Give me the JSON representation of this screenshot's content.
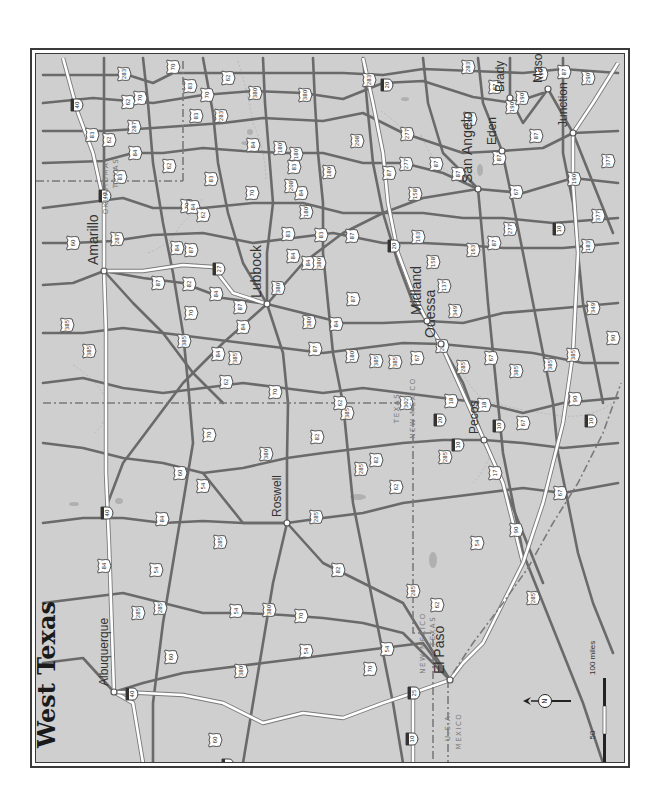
{
  "title": "West Texas",
  "orientation": "rotated-90-north-left",
  "colors": {
    "background": "#cfcfcf",
    "frame": "#3a3a3a",
    "us_highway": "#6a6a6a",
    "interstate": "#ffffff",
    "border": "#7a7a7a",
    "water": "#b0b0b0"
  },
  "cities": [
    {
      "name": "Amarillo",
      "x": 101,
      "y": 268,
      "label_dx": 12,
      "label_dy": -2,
      "size": "lg"
    },
    {
      "name": "Lubbock",
      "x": 264,
      "y": 301,
      "label_dx": -6,
      "label_dy": -22,
      "size": "lg"
    },
    {
      "name": "Albuquerque",
      "x": 111,
      "y": 689,
      "label_dx": 10,
      "label_dy": -10,
      "size": "sm"
    },
    {
      "name": "Roswell",
      "x": 284,
      "y": 520,
      "label_dx": 4,
      "label_dy": -6,
      "size": "sm"
    },
    {
      "name": "El Paso",
      "x": 447,
      "y": 677,
      "label_dx": -10,
      "label_dy": -14,
      "size": "lg"
    },
    {
      "name": "Pecos",
      "x": 481,
      "y": 437,
      "label_dx": 10,
      "label_dy": 4,
      "size": "sm"
    },
    {
      "name": "Odessa",
      "x": 438,
      "y": 341,
      "label_dx": 4,
      "label_dy": -4,
      "size": "lg"
    },
    {
      "name": "Midland",
      "x": 424,
      "y": 318,
      "label_dx": -6,
      "label_dy": -6,
      "size": "lg"
    },
    {
      "name": "San Angelo",
      "x": 475,
      "y": 186,
      "label_dx": 6,
      "label_dy": -6,
      "size": "lg"
    },
    {
      "name": "Eden",
      "x": 499,
      "y": 148,
      "label_dx": 4,
      "label_dy": 4,
      "size": "sm"
    },
    {
      "name": "Brady",
      "x": 507,
      "y": 95,
      "label_dx": 4,
      "label_dy": 6,
      "size": "sm"
    },
    {
      "name": "Mason",
      "x": 545,
      "y": 86,
      "label_dx": -6,
      "label_dy": -4,
      "size": "sm"
    },
    {
      "name": "Junction",
      "x": 570,
      "y": 130,
      "label_dx": 8,
      "label_dy": 4,
      "size": "sm"
    }
  ],
  "state_labels": [
    {
      "text": "OKLAHOMA",
      "x": 105,
      "y": 185
    },
    {
      "text": "TEXAS",
      "x": 115,
      "y": 170
    },
    {
      "text": "TEXAS",
      "x": 396,
      "y": 405
    },
    {
      "text": "NEW MEXICO",
      "x": 412,
      "y": 405
    },
    {
      "text": "NEW MEXICO",
      "x": 422,
      "y": 640
    },
    {
      "text": "TEXAS",
      "x": 432,
      "y": 628
    },
    {
      "text": "U.S.A.",
      "x": 447,
      "y": 723
    },
    {
      "text": "MEXICO",
      "x": 458,
      "y": 728
    }
  ],
  "shields": [
    {
      "type": "I",
      "num": "40",
      "x": 128,
      "y": 691
    },
    {
      "type": "I",
      "num": "40",
      "x": 103,
      "y": 510
    },
    {
      "type": "I",
      "num": "40",
      "x": 73,
      "y": 102
    },
    {
      "type": "I",
      "num": "40",
      "x": 101,
      "y": 193
    },
    {
      "type": "I",
      "num": "25",
      "x": 410,
      "y": 690
    },
    {
      "type": "I",
      "num": "25",
      "x": 224,
      "y": 762
    },
    {
      "type": "I",
      "num": "10",
      "x": 408,
      "y": 736
    },
    {
      "type": "I",
      "num": "10",
      "x": 454,
      "y": 442
    },
    {
      "type": "I",
      "num": "10",
      "x": 495,
      "y": 423
    },
    {
      "type": "I",
      "num": "10",
      "x": 587,
      "y": 418
    },
    {
      "type": "I",
      "num": "10",
      "x": 555,
      "y": 226
    },
    {
      "type": "I",
      "num": "20",
      "x": 390,
      "y": 243
    },
    {
      "type": "I",
      "num": "20",
      "x": 436,
      "y": 417
    },
    {
      "type": "I",
      "num": "27",
      "x": 215,
      "y": 266
    },
    {
      "type": "I",
      "num": "20",
      "x": 383,
      "y": 82
    },
    {
      "type": "US",
      "num": "60",
      "x": 70,
      "y": 240
    },
    {
      "type": "US",
      "num": "287",
      "x": 114,
      "y": 236
    },
    {
      "type": "US",
      "num": "83",
      "x": 117,
      "y": 174
    },
    {
      "type": "US",
      "num": "62",
      "x": 125,
      "y": 99
    },
    {
      "type": "US",
      "num": "283",
      "x": 121,
      "y": 71
    },
    {
      "type": "US",
      "num": "70",
      "x": 184,
      "y": 203
    },
    {
      "type": "US",
      "num": "83",
      "x": 208,
      "y": 176
    },
    {
      "type": "US",
      "num": "70",
      "x": 204,
      "y": 92
    },
    {
      "type": "US",
      "num": "87",
      "x": 237,
      "y": 304
    },
    {
      "type": "US",
      "num": "84",
      "x": 174,
      "y": 245
    },
    {
      "type": "US",
      "num": "84",
      "x": 240,
      "y": 324
    },
    {
      "type": "US",
      "num": "385",
      "x": 86,
      "y": 348
    },
    {
      "type": "US",
      "num": "385",
      "x": 232,
      "y": 355
    },
    {
      "type": "US",
      "num": "62",
      "x": 223,
      "y": 379
    },
    {
      "type": "US",
      "num": "70",
      "x": 272,
      "y": 389
    },
    {
      "type": "US",
      "num": "84",
      "x": 290,
      "y": 253
    },
    {
      "type": "US",
      "num": "380",
      "x": 252,
      "y": 90
    },
    {
      "type": "US",
      "num": "380",
      "x": 306,
      "y": 319
    },
    {
      "type": "US",
      "num": "180",
      "x": 293,
      "y": 151
    },
    {
      "type": "US",
      "num": "83",
      "x": 318,
      "y": 232
    },
    {
      "type": "US",
      "num": "87",
      "x": 350,
      "y": 296
    },
    {
      "type": "US",
      "num": "84",
      "x": 305,
      "y": 260
    },
    {
      "type": "US",
      "num": "385",
      "x": 373,
      "y": 358
    },
    {
      "type": "US",
      "num": "180",
      "x": 349,
      "y": 353
    },
    {
      "type": "US",
      "num": "285",
      "x": 410,
      "y": 588
    },
    {
      "type": "US",
      "num": "285",
      "x": 358,
      "y": 466
    },
    {
      "type": "US",
      "num": "380",
      "x": 263,
      "y": 451
    },
    {
      "type": "US",
      "num": "285",
      "x": 313,
      "y": 514
    },
    {
      "type": "US",
      "num": "82",
      "x": 314,
      "y": 434
    },
    {
      "type": "US",
      "num": "82",
      "x": 373,
      "y": 457
    },
    {
      "type": "US",
      "num": "70",
      "x": 206,
      "y": 432
    },
    {
      "type": "US",
      "num": "60",
      "x": 177,
      "y": 470
    },
    {
      "type": "US",
      "num": "84",
      "x": 159,
      "y": 516
    },
    {
      "type": "US",
      "num": "54",
      "x": 200,
      "y": 483
    },
    {
      "type": "US",
      "num": "285",
      "x": 217,
      "y": 539
    },
    {
      "type": "US",
      "num": "54",
      "x": 153,
      "y": 567
    },
    {
      "type": "US",
      "num": "285",
      "x": 157,
      "y": 605
    },
    {
      "type": "US",
      "num": "84",
      "x": 101,
      "y": 563
    },
    {
      "type": "US",
      "num": "54",
      "x": 233,
      "y": 608
    },
    {
      "type": "US",
      "num": "380",
      "x": 266,
      "y": 607
    },
    {
      "type": "US",
      "num": "70",
      "x": 298,
      "y": 613
    },
    {
      "type": "US",
      "num": "82",
      "x": 335,
      "y": 567
    },
    {
      "type": "US",
      "num": "54",
      "x": 303,
      "y": 648
    },
    {
      "type": "US",
      "num": "380",
      "x": 238,
      "y": 668
    },
    {
      "type": "US",
      "num": "54",
      "x": 384,
      "y": 646
    },
    {
      "type": "US",
      "num": "70",
      "x": 367,
      "y": 666
    },
    {
      "type": "US",
      "num": "60",
      "x": 212,
      "y": 737
    },
    {
      "type": "US",
      "num": "60",
      "x": 168,
      "y": 654
    },
    {
      "type": "US",
      "num": "285",
      "x": 135,
      "y": 610
    },
    {
      "type": "US",
      "num": "62",
      "x": 434,
      "y": 602
    },
    {
      "type": "US",
      "num": "54",
      "x": 474,
      "y": 540
    },
    {
      "type": "US",
      "num": "90",
      "x": 513,
      "y": 527
    },
    {
      "type": "US",
      "num": "285",
      "x": 442,
      "y": 454
    },
    {
      "type": "US",
      "num": "17",
      "x": 492,
      "y": 470
    },
    {
      "type": "US",
      "num": "67",
      "x": 557,
      "y": 490
    },
    {
      "type": "US",
      "num": "18",
      "x": 448,
      "y": 398
    },
    {
      "type": "US",
      "num": "18",
      "x": 481,
      "y": 402
    },
    {
      "type": "US",
      "num": "67",
      "x": 520,
      "y": 420
    },
    {
      "type": "US",
      "num": "385",
      "x": 513,
      "y": 368
    },
    {
      "type": "US",
      "num": "90",
      "x": 572,
      "y": 396
    },
    {
      "type": "US",
      "num": "385",
      "x": 547,
      "y": 362
    },
    {
      "type": "US",
      "num": "67",
      "x": 488,
      "y": 355
    },
    {
      "type": "US",
      "num": "285",
      "x": 439,
      "y": 343
    },
    {
      "type": "US",
      "num": "87",
      "x": 386,
      "y": 170
    },
    {
      "type": "US",
      "num": "277",
      "x": 403,
      "y": 161
    },
    {
      "type": "US",
      "num": "208",
      "x": 354,
      "y": 138
    },
    {
      "type": "US",
      "num": "87",
      "x": 433,
      "y": 161
    },
    {
      "type": "US",
      "num": "87",
      "x": 496,
      "y": 155
    },
    {
      "type": "US",
      "num": "67",
      "x": 513,
      "y": 189
    },
    {
      "type": "US",
      "num": "87",
      "x": 533,
      "y": 133
    },
    {
      "type": "US",
      "num": "277",
      "x": 507,
      "y": 226
    },
    {
      "type": "US",
      "num": "190",
      "x": 509,
      "y": 104
    },
    {
      "type": "US",
      "num": "377",
      "x": 605,
      "y": 158
    },
    {
      "type": "US",
      "num": "377",
      "x": 595,
      "y": 213
    },
    {
      "type": "US",
      "num": "283",
      "x": 467,
      "y": 116
    },
    {
      "type": "US",
      "num": "87",
      "x": 492,
      "y": 84
    },
    {
      "type": "US",
      "num": "190",
      "x": 519,
      "y": 95
    },
    {
      "type": "US",
      "num": "87",
      "x": 561,
      "y": 69
    },
    {
      "type": "US",
      "num": "290",
      "x": 585,
      "y": 75
    },
    {
      "type": "US",
      "num": "190",
      "x": 571,
      "y": 176
    },
    {
      "type": "US",
      "num": "283",
      "x": 465,
      "y": 64
    },
    {
      "type": "US",
      "num": "190",
      "x": 538,
      "y": 71
    },
    {
      "type": "US",
      "num": "90",
      "x": 610,
      "y": 335
    },
    {
      "type": "US",
      "num": "385",
      "x": 570,
      "y": 352
    },
    {
      "type": "US",
      "num": "349",
      "x": 590,
      "y": 305
    },
    {
      "type": "US",
      "num": "183",
      "x": 585,
      "y": 243
    },
    {
      "type": "US",
      "num": "349",
      "x": 452,
      "y": 308
    },
    {
      "type": "US",
      "num": "137",
      "x": 441,
      "y": 283
    },
    {
      "type": "US",
      "num": "158",
      "x": 430,
      "y": 259
    },
    {
      "type": "US",
      "num": "163",
      "x": 470,
      "y": 247
    },
    {
      "type": "US",
      "num": "87",
      "x": 491,
      "y": 240
    },
    {
      "type": "US",
      "num": "158",
      "x": 412,
      "y": 191
    },
    {
      "type": "US",
      "num": "163",
      "x": 415,
      "y": 234
    },
    {
      "type": "US",
      "num": "87",
      "x": 455,
      "y": 171
    },
    {
      "type": "US",
      "num": "277",
      "x": 404,
      "y": 131
    },
    {
      "type": "US",
      "num": "283",
      "x": 366,
      "y": 77
    },
    {
      "type": "US",
      "num": "180",
      "x": 277,
      "y": 145
    },
    {
      "type": "US",
      "num": "380",
      "x": 302,
      "y": 92
    },
    {
      "type": "US",
      "num": "84",
      "x": 250,
      "y": 142
    },
    {
      "type": "US",
      "num": "70",
      "x": 249,
      "y": 190
    },
    {
      "type": "US",
      "num": "87",
      "x": 312,
      "y": 346
    },
    {
      "type": "US",
      "num": "180",
      "x": 326,
      "y": 169
    },
    {
      "type": "US",
      "num": "285",
      "x": 460,
      "y": 364
    },
    {
      "type": "US",
      "num": "385",
      "x": 64,
      "y": 322
    },
    {
      "type": "US",
      "num": "87",
      "x": 155,
      "y": 280
    },
    {
      "type": "US",
      "num": "84",
      "x": 132,
      "y": 150
    },
    {
      "type": "US",
      "num": "62",
      "x": 106,
      "y": 137
    },
    {
      "type": "US",
      "num": "287",
      "x": 131,
      "y": 124
    },
    {
      "type": "US",
      "num": "83",
      "x": 89,
      "y": 132
    },
    {
      "type": "US",
      "num": "70",
      "x": 137,
      "y": 95
    },
    {
      "type": "US",
      "num": "83",
      "x": 193,
      "y": 113
    },
    {
      "type": "US",
      "num": "62",
      "x": 225,
      "y": 75
    },
    {
      "type": "US",
      "num": "283",
      "x": 218,
      "y": 113
    },
    {
      "type": "US",
      "num": "70",
      "x": 170,
      "y": 64
    },
    {
      "type": "US",
      "num": "83",
      "x": 187,
      "y": 83
    },
    {
      "type": "US",
      "num": "62",
      "x": 166,
      "y": 163
    },
    {
      "type": "US",
      "num": "87",
      "x": 188,
      "y": 247
    },
    {
      "type": "US",
      "num": "84",
      "x": 190,
      "y": 204
    },
    {
      "type": "US",
      "num": "62",
      "x": 200,
      "y": 212
    },
    {
      "type": "US",
      "num": "70",
      "x": 188,
      "y": 310
    },
    {
      "type": "US",
      "num": "82",
      "x": 186,
      "y": 281
    },
    {
      "type": "US",
      "num": "84",
      "x": 213,
      "y": 291
    },
    {
      "type": "US",
      "num": "84",
      "x": 215,
      "y": 351
    },
    {
      "type": "US",
      "num": "385",
      "x": 181,
      "y": 338
    },
    {
      "type": "US",
      "num": "380",
      "x": 275,
      "y": 285
    },
    {
      "type": "US",
      "num": "84",
      "x": 333,
      "y": 321
    },
    {
      "type": "US",
      "num": "380",
      "x": 316,
      "y": 260
    },
    {
      "type": "US",
      "num": "87",
      "x": 349,
      "y": 233
    },
    {
      "type": "US",
      "num": "83",
      "x": 285,
      "y": 231
    },
    {
      "type": "US",
      "num": "180",
      "x": 303,
      "y": 209
    },
    {
      "type": "US",
      "num": "84",
      "x": 298,
      "y": 190
    },
    {
      "type": "US",
      "num": "83",
      "x": 291,
      "y": 164
    },
    {
      "type": "US",
      "num": "208",
      "x": 288,
      "y": 183
    },
    {
      "type": "US",
      "num": "385",
      "x": 344,
      "y": 410
    },
    {
      "type": "US",
      "num": "62",
      "x": 337,
      "y": 400
    },
    {
      "type": "US",
      "num": "62",
      "x": 393,
      "y": 484
    },
    {
      "type": "US",
      "num": "302",
      "x": 403,
      "y": 400
    },
    {
      "type": "US",
      "num": "385",
      "x": 392,
      "y": 359
    },
    {
      "type": "US",
      "num": "67",
      "x": 414,
      "y": 355
    },
    {
      "type": "US",
      "num": "285",
      "x": 530,
      "y": 595
    }
  ],
  "scale_bar": {
    "label_0": "0",
    "label_50": "50",
    "label_100": "100 miles"
  },
  "north_arrow": {
    "label": "N"
  }
}
